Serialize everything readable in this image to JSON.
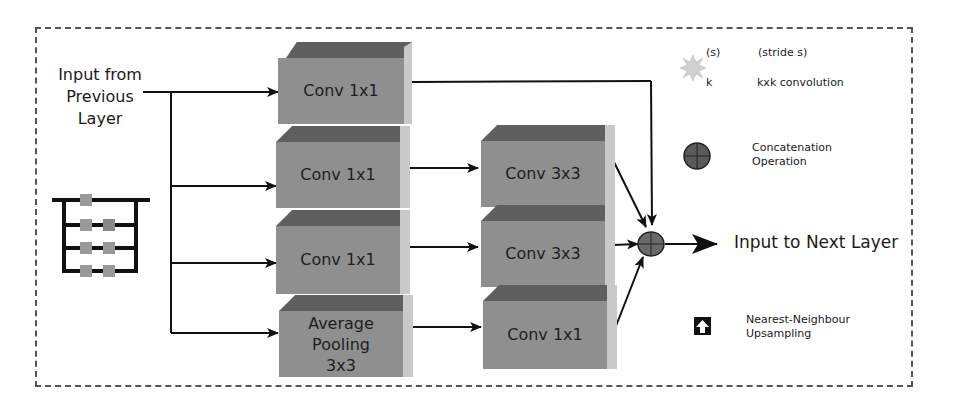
{
  "input_label": [
    "Input from",
    "Previous",
    "Layer"
  ],
  "output_label": "Input to Next Layer",
  "column1": [
    {
      "label": "Conv 1x1"
    },
    {
      "label": "Conv 1x1"
    },
    {
      "label": "Conv 1x1"
    },
    {
      "label": [
        "Average",
        "Pooling",
        "3x3"
      ]
    }
  ],
  "column2": [
    {
      "label": "Conv 3x3"
    },
    {
      "label": "Conv 3x3"
    },
    {
      "label": "Conv 1x1"
    }
  ],
  "legend": {
    "stride_marker": "(s)",
    "stride_text": "(stride s)",
    "kernel_marker": "k",
    "kernel_text": "kxk convolution",
    "concat_text": [
      "Concatenation",
      "Operation"
    ],
    "upsample_text": [
      "Nearest-Neighbour",
      "Upsampling"
    ]
  },
  "colors": {
    "box_front": "#8f8f8f",
    "box_top": "#5f5f5f",
    "box_side": "#c9c9c9",
    "concat": "#6a6a6a",
    "border": "#555555"
  }
}
